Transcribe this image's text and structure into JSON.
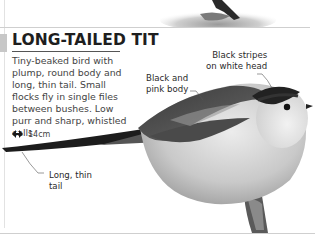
{
  "entry": {
    "title": "LONG-TAILED TIT",
    "description": "Tiny-beaked bird with plump, round body and long, thin tail. Small flocks fly in single files between bushes. Low purr and sharp, whistled calls.",
    "size_icon": "double-arrow-size-icon",
    "size": "14cm"
  },
  "annotations": {
    "head": {
      "line1": "Black stripes",
      "line2": "on white head"
    },
    "body": {
      "line1": "Black and",
      "line2": "pink body"
    },
    "tail": {
      "line1": "Long, thin",
      "line2": "tail"
    }
  },
  "colors": {
    "title_accent": "#c7c7c7",
    "title_text": "#1e1e1e",
    "rule": "#cfcfcf"
  }
}
